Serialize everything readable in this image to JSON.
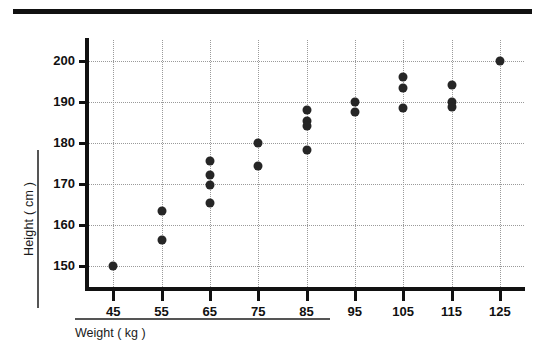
{
  "figure": {
    "top_rule": "decorative-rule"
  },
  "chart_data": {
    "type": "scatter",
    "title": "",
    "xlabel": "Weight ( kg )",
    "ylabel": "Height ( cm )",
    "xlim": [
      40,
      130
    ],
    "ylim": [
      145,
      205
    ],
    "grid": true,
    "legend": "none",
    "xticks": [
      45,
      55,
      65,
      75,
      85,
      95,
      105,
      115,
      125
    ],
    "xtick_labels": [
      "45",
      "55",
      "65",
      "75",
      "85",
      "95",
      "105",
      "115",
      "125"
    ],
    "yticks": [
      150,
      160,
      170,
      180,
      190,
      200
    ],
    "ytick_labels": [
      "150",
      "160",
      "170",
      "180",
      "190",
      "200"
    ],
    "marker_color": "#262626",
    "points": [
      {
        "x": 45,
        "y": 150.0
      },
      {
        "x": 55,
        "y": 163.5
      },
      {
        "x": 55,
        "y": 156.5
      },
      {
        "x": 65,
        "y": 175.5
      },
      {
        "x": 65,
        "y": 172.2
      },
      {
        "x": 65,
        "y": 169.8
      },
      {
        "x": 65,
        "y": 165.5
      },
      {
        "x": 75,
        "y": 180.0
      },
      {
        "x": 75,
        "y": 174.5
      },
      {
        "x": 85,
        "y": 188.0
      },
      {
        "x": 85,
        "y": 185.3
      },
      {
        "x": 85,
        "y": 184.0
      },
      {
        "x": 85,
        "y": 178.3
      },
      {
        "x": 95,
        "y": 190.0
      },
      {
        "x": 95,
        "y": 187.5
      },
      {
        "x": 105,
        "y": 196.0
      },
      {
        "x": 105,
        "y": 193.3
      },
      {
        "x": 105,
        "y": 188.5
      },
      {
        "x": 115,
        "y": 194.0
      },
      {
        "x": 115,
        "y": 190.0
      },
      {
        "x": 115,
        "y": 188.8
      },
      {
        "x": 125,
        "y": 200.0
      }
    ]
  }
}
